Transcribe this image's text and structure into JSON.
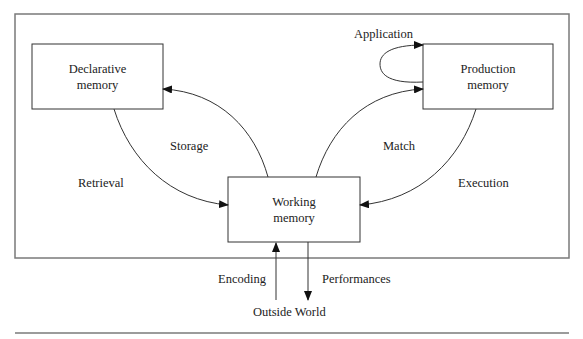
{
  "diagram": {
    "nodes": {
      "declarative": {
        "line1": "Declarative",
        "line2": "memory"
      },
      "production": {
        "line1": "Production",
        "line2": "memory"
      },
      "working": {
        "line1": "Working",
        "line2": "memory"
      },
      "outside": {
        "label": "Outside World"
      }
    },
    "edges": {
      "retrieval": "Retrieval",
      "storage": "Storage",
      "match": "Match",
      "execution": "Execution",
      "application": "Application",
      "encoding": "Encoding",
      "performances": "Performances"
    },
    "colors": {
      "line": "#333333",
      "frame": "#7a7a7a",
      "background": "#ffffff"
    }
  }
}
